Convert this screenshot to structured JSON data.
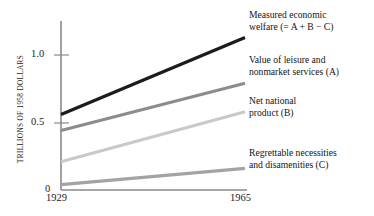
{
  "chart_data": {
    "type": "line",
    "title": "",
    "xlabel": "",
    "ylabel": "TRILLIONS OF 1958 DOLLARS",
    "x": [
      1929,
      1965
    ],
    "xticklabels": [
      "1929",
      "1965"
    ],
    "yticks": [
      0,
      0.5,
      1.0
    ],
    "yticklabels": [
      "0",
      "0.5",
      "1.0"
    ],
    "ylim": [
      0,
      1.25
    ],
    "xlim": [
      1929,
      1965
    ],
    "grid": false,
    "legend_position": "right-inline-labels",
    "series": [
      {
        "name": "Measured economic welfare (= A + B − C)",
        "label_line1": "Measured economic",
        "label_line2": "welfare (= A + B − C)",
        "values": [
          0.56,
          1.13
        ],
        "color": "#1c1c1c"
      },
      {
        "name": "Value of leisure and nonmarket services (A)",
        "label_line1": "Value of leisure and",
        "label_line2": "nonmarket services (A)",
        "values": [
          0.44,
          0.79
        ],
        "color": "#8c8c8c"
      },
      {
        "name": "Net national product (B)",
        "label_line1": "Net national",
        "label_line2": "product (B)",
        "values": [
          0.21,
          0.58
        ],
        "color": "#c9c9c9"
      },
      {
        "name": "Regrettable necessities and disamenities (C)",
        "label_line1": "Regrettable necessities",
        "label_line2": "and disamenities (C)",
        "values": [
          0.04,
          0.16
        ],
        "color": "#a3a3a3"
      }
    ]
  },
  "axis": {
    "y_title": "TRILLIONS OF 1958 DOLLARS",
    "y_tick_1": "1.0",
    "y_tick_05": "0.5",
    "y_tick_0": "0",
    "x_tick_start": "1929",
    "x_tick_end": "1965"
  },
  "labels": {
    "mew_line1": "Measured economic",
    "mew_line2": "welfare (= A + B − C)",
    "leisure_line1": "Value of leisure and",
    "leisure_line2": "nonmarket services (A)",
    "nnp_line1": "Net national",
    "nnp_line2": "product (B)",
    "regret_line1": "Regrettable necessities",
    "regret_line2": "and disamenities (C)"
  },
  "colors": {
    "axis": "#8a8a8a",
    "text": "#141414",
    "background": "#ffffff",
    "series_mew": "#1c1c1c",
    "series_leisure": "#8c8c8c",
    "series_nnp": "#c9c9c9",
    "series_regret": "#a3a3a3"
  }
}
